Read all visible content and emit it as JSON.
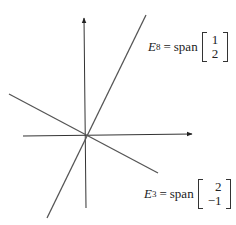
{
  "diagram": {
    "type": "eigenspaces-in-plane",
    "colors": {
      "axis": "#222222",
      "line": "#555555",
      "text": "#222222"
    },
    "axes": {
      "origin_px": [
        85,
        135
      ],
      "x_axis": {
        "from": [
          23,
          136
        ],
        "to": [
          192,
          134
        ]
      },
      "y_axis": {
        "from": [
          86,
          208
        ],
        "to": [
          84,
          18
        ]
      }
    },
    "lines": [
      {
        "id": "E8",
        "from": [
          47,
          218
        ],
        "to": [
          146,
          15
        ]
      },
      {
        "id": "E3",
        "from": [
          9,
          94
        ],
        "to": [
          158,
          173
        ]
      }
    ],
    "labels": {
      "e8": {
        "symbol": "E",
        "subscript": "8",
        "eq": "=",
        "word": "span",
        "vector": [
          "1",
          "2"
        ]
      },
      "e3": {
        "symbol": "E",
        "subscript": "3",
        "eq": "=",
        "word": "span",
        "vector": [
          "2",
          "−1"
        ]
      }
    }
  }
}
